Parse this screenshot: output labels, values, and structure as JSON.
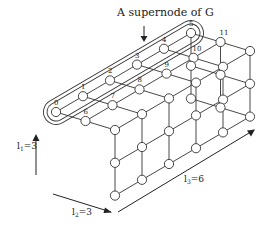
{
  "title_annotation": "A supernode of G",
  "dimensions": {
    "l1": {
      "label": "l",
      "sub": "1",
      "value": "=3"
    },
    "l2": {
      "label": "l",
      "sub": "2",
      "value": "=3"
    },
    "l3": {
      "label": "l",
      "sub": "3",
      "value": "=6"
    }
  },
  "node_labels": [
    "0",
    "1",
    "2",
    "3",
    "4",
    "5",
    "6",
    "7",
    "8",
    "9",
    "10",
    "11"
  ],
  "grid": {
    "l1": 3,
    "l2": 3,
    "l3": 6
  },
  "colors": {
    "line": "#333333",
    "node_fill": "#ffffff"
  }
}
